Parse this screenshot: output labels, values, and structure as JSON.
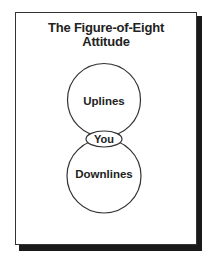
{
  "diagram": {
    "title_line1": "The Figure-of-Eight",
    "title_line2": "Attitude",
    "upper_circle_label": "Uplines",
    "center_label": "You",
    "lower_circle_label": "Downlines"
  }
}
